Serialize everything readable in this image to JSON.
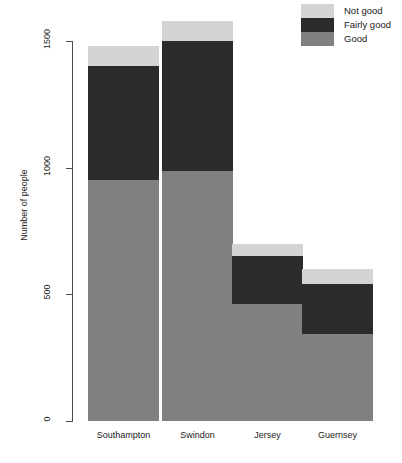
{
  "chart_data": {
    "type": "bar",
    "subtype": "stacked-bar",
    "title": "",
    "xlabel": "",
    "ylabel": "Number of people",
    "categories": [
      "Southampton",
      "Swindon",
      "Jersey",
      "Guernsey"
    ],
    "series": [
      {
        "name": "Good",
        "color": "#808080",
        "values": [
          950,
          985,
          460,
          345
        ]
      },
      {
        "name": "Fairly good",
        "color": "#2b2b2b",
        "values": [
          450,
          515,
          190,
          195
        ]
      },
      {
        "name": "Not good",
        "color": "#d4d4d4",
        "values": [
          80,
          80,
          50,
          60
        ]
      }
    ],
    "totals": [
      1480,
      1580,
      700,
      600
    ],
    "ylim": [
      0,
      1600
    ],
    "yticks": [
      0,
      500,
      1000,
      1500
    ],
    "ytick_labels": [
      "0",
      "500",
      "1000",
      "1500"
    ],
    "grid": false,
    "legend_position": "top-right",
    "legend_order": [
      "Not good",
      "Fairly good",
      "Good"
    ]
  },
  "axis": {
    "y_title": "Number of people",
    "y_ticks": [
      {
        "label": "1500",
        "value": 1500
      },
      {
        "label": "1000",
        "value": 1000
      },
      {
        "label": "500",
        "value": 500
      },
      {
        "label": "0",
        "value": 0
      }
    ]
  },
  "legend": {
    "items": [
      {
        "label": "Not good",
        "color": "#d4d4d4"
      },
      {
        "label": "Fairly good",
        "color": "#2b2b2b"
      },
      {
        "label": "Good",
        "color": "#808080"
      }
    ]
  },
  "bars": [
    {
      "category": "Southampton",
      "segments": [
        {
          "series": "Not good",
          "value": 80,
          "color": "#d4d4d4"
        },
        {
          "series": "Fairly good",
          "value": 450,
          "color": "#2b2b2b"
        },
        {
          "series": "Good",
          "value": 950,
          "color": "#808080"
        }
      ]
    },
    {
      "category": "Swindon",
      "segments": [
        {
          "series": "Not good",
          "value": 80,
          "color": "#d4d4d4"
        },
        {
          "series": "Fairly good",
          "value": 515,
          "color": "#2b2b2b"
        },
        {
          "series": "Good",
          "value": 985,
          "color": "#808080"
        }
      ]
    },
    {
      "category": "Jersey",
      "segments": [
        {
          "series": "Not good",
          "value": 50,
          "color": "#d4d4d4"
        },
        {
          "series": "Fairly good",
          "value": 190,
          "color": "#2b2b2b"
        },
        {
          "series": "Good",
          "value": 460,
          "color": "#808080"
        }
      ]
    },
    {
      "category": "Guernsey",
      "segments": [
        {
          "series": "Not good",
          "value": 60,
          "color": "#d4d4d4"
        },
        {
          "series": "Fairly good",
          "value": 195,
          "color": "#2b2b2b"
        },
        {
          "series": "Good",
          "value": 345,
          "color": "#808080"
        }
      ]
    }
  ],
  "style": {
    "axis_color": "#4d4d4d",
    "text_color": "#1a1a1a",
    "background": "#ffffff"
  }
}
